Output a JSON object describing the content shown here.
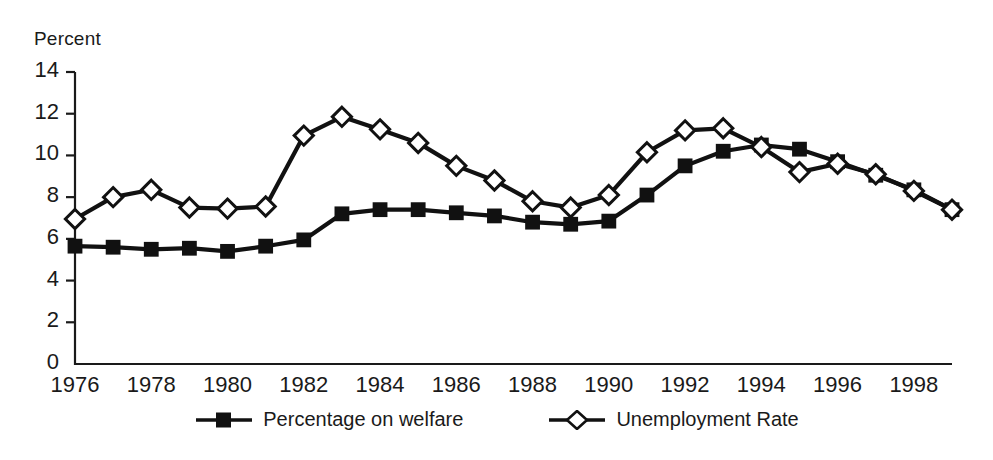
{
  "chart_data": {
    "type": "line",
    "title": "",
    "xlabel": "",
    "ylabel": "Percent",
    "xlim": [
      1976,
      1999
    ],
    "ylim": [
      0,
      14
    ],
    "yticks": [
      0,
      2,
      4,
      6,
      8,
      10,
      12,
      14
    ],
    "xticks": [
      1976,
      1978,
      1980,
      1982,
      1984,
      1986,
      1988,
      1990,
      1992,
      1994,
      1996,
      1998
    ],
    "grid": false,
    "legend_position": "bottom-center",
    "x": [
      1976,
      1977,
      1978,
      1979,
      1980,
      1981,
      1982,
      1983,
      1984,
      1985,
      1986,
      1987,
      1988,
      1989,
      1990,
      1991,
      1992,
      1993,
      1994,
      1995,
      1996,
      1997,
      1998,
      1999
    ],
    "series": [
      {
        "name": "Percentage on welfare",
        "marker": "filled-square",
        "color": "#111111",
        "values": [
          5.65,
          5.6,
          5.5,
          5.55,
          5.4,
          5.65,
          5.95,
          7.2,
          7.4,
          7.4,
          7.25,
          7.1,
          6.8,
          6.7,
          6.85,
          8.1,
          9.5,
          10.2,
          10.5,
          10.3,
          9.7,
          9.05,
          8.35,
          7.4
        ]
      },
      {
        "name": "Unemployment Rate",
        "marker": "open-diamond",
        "color": "#111111",
        "values": [
          6.95,
          8.0,
          8.35,
          7.5,
          7.45,
          7.55,
          10.95,
          11.85,
          11.25,
          10.6,
          9.5,
          8.8,
          7.8,
          7.5,
          8.1,
          10.15,
          11.2,
          11.3,
          10.4,
          9.2,
          9.6,
          9.1,
          8.3,
          7.4
        ]
      }
    ]
  },
  "legend": {
    "items": [
      {
        "label": "Percentage on welfare",
        "marker": "filled-square-marker"
      },
      {
        "label": "Unemployment Rate",
        "marker": "open-diamond-marker"
      }
    ]
  }
}
